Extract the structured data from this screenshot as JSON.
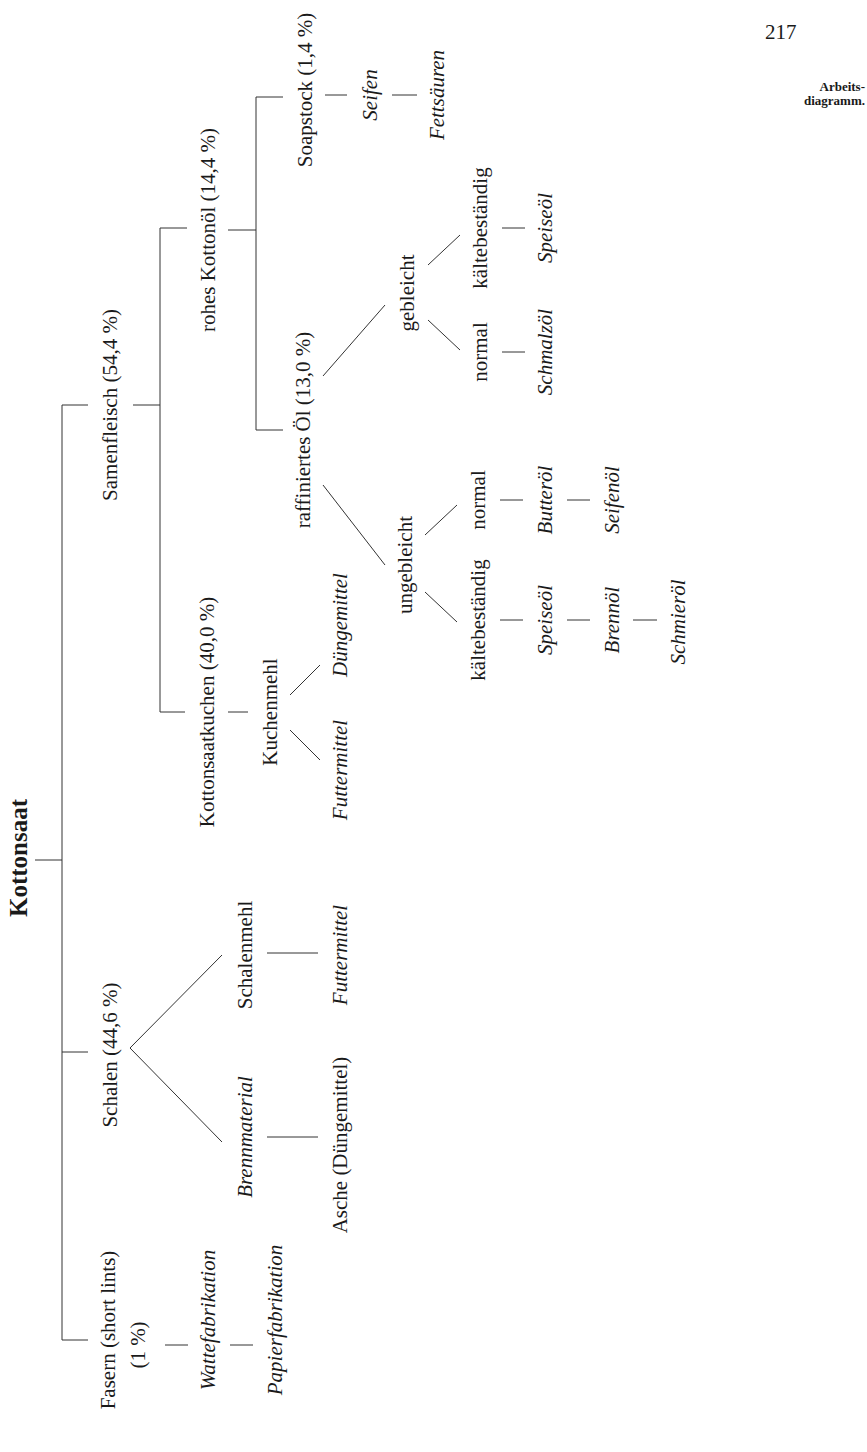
{
  "page": {
    "page_number": "217",
    "margin_note": [
      "Arbeits-",
      "diagramm."
    ]
  },
  "diagram": {
    "root": "Kottonsaat",
    "fasern": "Fasern (short lints)",
    "fasern_pct": "(1 %)",
    "wattefabrikation": "Wattefabrikation",
    "papierfabrikation": "Papierfabrikation",
    "schalen": "Schalen (44,6 %)",
    "brennmaterial": "Brennmaterial",
    "asche": "Asche (Düngemittel)",
    "schalenmehl": "Schalenmehl",
    "schalen_futtermittel": "Futtermittel",
    "samenfleisch": "Samenfleisch (54,4 %)",
    "kuchen": "Kottonsaatkuchen (40,0 %)",
    "kuchenmehl": "Kuchenmehl",
    "kuchen_futtermittel": "Futtermittel",
    "kuchen_duengemittel": "Düngemittel",
    "rohes_oel": "rohes Kottonöl (14,4 %)",
    "soapstock": "Soapstock (1,4 %)",
    "seifen": "Seifen",
    "fettsaeuren": "Fettsäuren",
    "raffiniertes_oel": "raffiniertes Öl (13,0 %)",
    "gebleicht": "gebleicht",
    "gebleicht_normal": "normal",
    "schmalzoel": "Schmalzöl",
    "gebleicht_kaeltebestaendig": "kältebeständig",
    "gebleicht_speiseoel": "Speiseöl",
    "ungebleicht": "ungebleicht",
    "ungebleicht_normal": "normal",
    "butteroel": "Butteröl",
    "seifenoel": "Seifenöl",
    "ungebleicht_kaeltebestaendig": "kältebeständig",
    "ungebleicht_speiseoel": "Speiseöl",
    "brennoel": "Brennöl",
    "schmieroel": "Schmieröl"
  }
}
